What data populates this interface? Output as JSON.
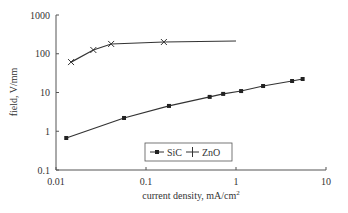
{
  "chart_data": {
    "type": "line",
    "title": "",
    "xlabel": "current density, mA/cm",
    "xlabel_superscript": "2",
    "ylabel": "field, V/mm",
    "xscale": "log",
    "yscale": "log",
    "xlim": [
      0.01,
      10
    ],
    "ylim": [
      0.1,
      1000
    ],
    "x_ticks": [
      "0.01",
      "0.1",
      "1",
      "10"
    ],
    "y_ticks": [
      "0.1",
      "1",
      "10",
      "100",
      "1000"
    ],
    "grid": false,
    "legend_position": "inside-bottom-center",
    "series": [
      {
        "name": "SiC",
        "marker": "square",
        "points": [
          [
            0.013,
            0.67
          ],
          [
            0.057,
            2.2
          ],
          [
            0.18,
            4.5
          ],
          [
            0.51,
            7.7
          ],
          [
            0.72,
            9.2
          ],
          [
            1.14,
            10.9
          ],
          [
            2.0,
            14.7
          ],
          [
            4.2,
            19.8
          ],
          [
            5.5,
            22.3
          ]
        ]
      },
      {
        "name": "ZnO",
        "marker": "x",
        "points": [
          [
            0.0147,
            61
          ],
          [
            0.026,
            125
          ],
          [
            0.041,
            179
          ],
          [
            0.158,
            201
          ]
        ],
        "line_extends_to": [
          1.0,
          213
        ]
      }
    ]
  },
  "legend": {
    "sic": "SiC",
    "zno": "ZnO"
  }
}
